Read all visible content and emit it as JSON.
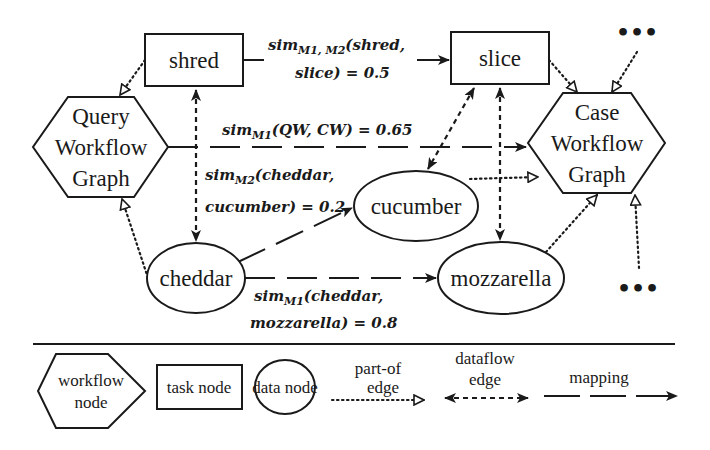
{
  "diagram": {
    "nodes": {
      "shred": {
        "label": "shred",
        "type": "task node"
      },
      "slice": {
        "label": "slice",
        "type": "task node"
      },
      "query_workflow": {
        "lines": [
          "Query",
          "Workflow",
          "Graph"
        ],
        "type": "workflow node"
      },
      "case_workflow": {
        "lines": [
          "Case",
          "Workflow",
          "Graph"
        ],
        "type": "workflow node"
      },
      "cucumber": {
        "label": "cucumber",
        "type": "data node"
      },
      "cheddar": {
        "label": "cheddar",
        "type": "data node"
      },
      "mozzarella": {
        "label": "mozzarella",
        "type": "data node"
      }
    },
    "ellipsis": "•••",
    "mappings": {
      "shred_slice": {
        "sim": "sim",
        "sub": "M1, M2",
        "line1_rest": "(shred,",
        "line2": "slice) = 0.5"
      },
      "qw_cw": {
        "sim": "sim",
        "sub": "M1",
        "rest": "(QW, CW) = 0.65"
      },
      "cheddar_cucumber": {
        "sim": "sim",
        "sub": "M2",
        "line1_rest": "(cheddar,",
        "line2": "cucumber) = 0.2"
      },
      "cheddar_mozzarella": {
        "sim": "sim",
        "sub": "M1",
        "line1_rest": "(cheddar,",
        "line2": "mozzarella) = 0.8"
      }
    }
  },
  "legend": {
    "workflow_node": [
      "workflow",
      "node"
    ],
    "task_node": "task node",
    "data_node": "data node",
    "partof_edge": [
      "part-of",
      "edge"
    ],
    "dataflow_edge": [
      "dataflow",
      "edge"
    ],
    "mapping": "mapping"
  },
  "colors": {
    "stroke": "#1a1a1a",
    "background": "#ffffff"
  }
}
